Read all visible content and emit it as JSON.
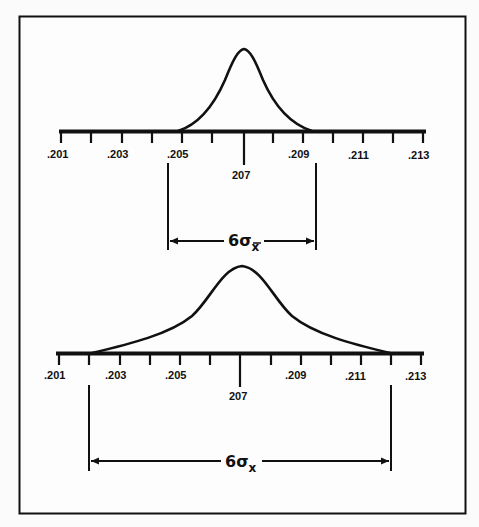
{
  "diagram": {
    "top_panel": {
      "tick_labels": [
        ".201",
        ".203",
        ".205",
        "207",
        ".209",
        ".211",
        ".213"
      ],
      "center_label": "207",
      "span_label": "6σ",
      "span_subscript": "x̄",
      "span_description": "6 sigma of sample means (x-bar)"
    },
    "bottom_panel": {
      "tick_labels": [
        ".201",
        ".203",
        ".205",
        "207",
        ".209",
        ".211",
        ".213"
      ],
      "center_label": "207",
      "span_label": "6σ",
      "span_subscript": "x",
      "span_description": "6 sigma of individual values (x)"
    },
    "labels": {
      "l201": ".201",
      "l203": ".203",
      "l205": ".205",
      "l207": "207",
      "l209": ".209",
      "l211": ".211",
      "l213": ".213",
      "sigma": "6σ",
      "sub_xbar": "x",
      "sub_x": "x"
    }
  }
}
